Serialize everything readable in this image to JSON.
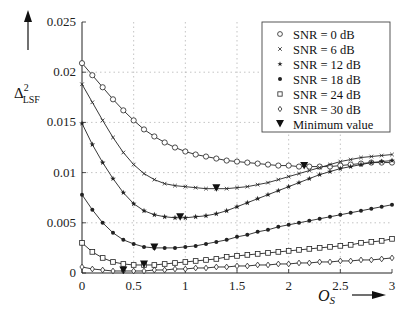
{
  "chart_data": {
    "type": "line",
    "title": "",
    "xlabel": "O_S",
    "ylabel": "Δ²_LSF",
    "xlim": [
      0,
      3
    ],
    "ylim": [
      0,
      0.025
    ],
    "grid": true,
    "legend_position": "upper right",
    "x_ticks": [
      "0",
      "0.5",
      "1",
      "1.5",
      "2",
      "2.5",
      "3"
    ],
    "y_ticks": [
      "0",
      "0.005",
      "0.01",
      "0.015",
      "0.02",
      "0.025"
    ],
    "x": [
      0,
      0.1,
      0.2,
      0.3,
      0.4,
      0.5,
      0.6,
      0.7,
      0.8,
      0.9,
      1.0,
      1.1,
      1.2,
      1.3,
      1.4,
      1.5,
      1.6,
      1.7,
      1.8,
      1.9,
      2.0,
      2.1,
      2.2,
      2.3,
      2.4,
      2.5,
      2.6,
      2.7,
      2.8,
      2.9,
      3.0
    ],
    "series": [
      {
        "name": "SNR = 0 dB",
        "marker": "circle",
        "values": [
          0.0209,
          0.0197,
          0.0185,
          0.0173,
          0.0162,
          0.0152,
          0.0143,
          0.0136,
          0.013,
          0.0125,
          0.0121,
          0.0118,
          0.0116,
          0.0114,
          0.0112,
          0.0111,
          0.011,
          0.0109,
          0.0108,
          0.0107,
          0.0107,
          0.0106,
          0.0106,
          0.0106,
          0.0106,
          0.0107,
          0.0108,
          0.0109,
          0.011,
          0.011,
          0.011
        ]
      },
      {
        "name": "SNR = 6 dB",
        "marker": "x",
        "values": [
          0.0188,
          0.017,
          0.0152,
          0.0135,
          0.012,
          0.0108,
          0.0099,
          0.0093,
          0.0089,
          0.0087,
          0.0086,
          0.0085,
          0.0084,
          0.0084,
          0.0084,
          0.0085,
          0.0086,
          0.0088,
          0.009,
          0.0093,
          0.0096,
          0.0099,
          0.0102,
          0.0105,
          0.0108,
          0.0111,
          0.0113,
          0.0115,
          0.0116,
          0.0117,
          0.0118
        ]
      },
      {
        "name": "SNR = 12 dB",
        "marker": "star",
        "values": [
          0.0149,
          0.0128,
          0.011,
          0.0094,
          0.008,
          0.0069,
          0.0062,
          0.0058,
          0.0056,
          0.0055,
          0.0055,
          0.0056,
          0.0057,
          0.0059,
          0.0062,
          0.0066,
          0.007,
          0.0074,
          0.0078,
          0.0082,
          0.0086,
          0.009,
          0.0094,
          0.0098,
          0.0101,
          0.0104,
          0.0106,
          0.0108,
          0.011,
          0.0111,
          0.0112
        ]
      },
      {
        "name": "SNR = 18 dB",
        "marker": "dot",
        "values": [
          0.0078,
          0.0063,
          0.005,
          0.004,
          0.0033,
          0.0029,
          0.0026,
          0.0025,
          0.0025,
          0.0025,
          0.0026,
          0.0027,
          0.0029,
          0.0031,
          0.0033,
          0.0036,
          0.0038,
          0.0041,
          0.0043,
          0.0046,
          0.0048,
          0.005,
          0.0052,
          0.0054,
          0.0056,
          0.0058,
          0.006,
          0.0062,
          0.0064,
          0.0066,
          0.0068
        ]
      },
      {
        "name": "SNR = 24 dB",
        "marker": "square",
        "values": [
          0.003,
          0.0021,
          0.0015,
          0.0011,
          0.0009,
          0.0008,
          0.0008,
          0.0008,
          0.0009,
          0.001,
          0.0011,
          0.0012,
          0.0013,
          0.0014,
          0.0016,
          0.0017,
          0.0018,
          0.0019,
          0.002,
          0.0021,
          0.0022,
          0.0023,
          0.0024,
          0.0025,
          0.0026,
          0.0027,
          0.0028,
          0.003,
          0.0031,
          0.0032,
          0.0034
        ]
      },
      {
        "name": "SNR = 30 dB",
        "marker": "diamond",
        "values": [
          0.0006,
          0.0004,
          0.0003,
          0.0002,
          0.0002,
          0.0002,
          0.0002,
          0.0003,
          0.0003,
          0.0004,
          0.0004,
          0.0005,
          0.0005,
          0.0006,
          0.0006,
          0.0007,
          0.0007,
          0.0008,
          0.0008,
          0.0009,
          0.0009,
          0.001,
          0.001,
          0.0011,
          0.0011,
          0.0012,
          0.0012,
          0.0013,
          0.0013,
          0.0014,
          0.0015
        ]
      }
    ],
    "minimum_points": {
      "name": "Minimum value",
      "marker": "triangle-down",
      "points": [
        {
          "series": "SNR = 0 dB",
          "x": 2.15,
          "y": 0.0106
        },
        {
          "series": "SNR = 6 dB",
          "x": 1.3,
          "y": 0.0084
        },
        {
          "series": "SNR = 12 dB",
          "x": 0.95,
          "y": 0.0055
        },
        {
          "series": "SNR = 18 dB",
          "x": 0.7,
          "y": 0.0025
        },
        {
          "series": "SNR = 24 dB",
          "x": 0.6,
          "y": 0.0008
        },
        {
          "series": "SNR = 30 dB",
          "x": 0.4,
          "y": 0.0002
        }
      ]
    }
  },
  "labels": {
    "ylabel_main": "Δ",
    "ylabel_sup": "2",
    "ylabel_sub": "LSF",
    "xlabel_main": "O",
    "xlabel_sub": "S"
  },
  "legend": [
    {
      "label": "SNR = 0 dB",
      "marker": "circle"
    },
    {
      "label": "SNR = 6 dB",
      "marker": "x"
    },
    {
      "label": "SNR = 12 dB",
      "marker": "star"
    },
    {
      "label": "SNR = 18 dB",
      "marker": "dot"
    },
    {
      "label": "SNR = 24 dB",
      "marker": "square"
    },
    {
      "label": "SNR = 30 dB",
      "marker": "diamond"
    },
    {
      "label": "Minimum value",
      "marker": "triangle-down"
    }
  ]
}
